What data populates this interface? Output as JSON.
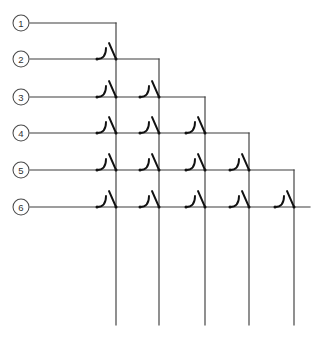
{
  "diagram": {
    "type": "schematic",
    "canvas": {
      "width": 319,
      "height": 340
    },
    "colors": {
      "line": "#3d3d3d",
      "switch": "#111111",
      "node_stroke": "#4a4a4a",
      "background": "#ffffff"
    },
    "geometry": {
      "node_center_x": 21,
      "node_radius": 8,
      "row_y": [
        23,
        59,
        97,
        133,
        170,
        207
      ],
      "column_x": [
        116,
        159,
        205,
        249,
        294
      ],
      "column_bottom_y": 325,
      "row_right_end_x": 310,
      "hook_offset_x": -19,
      "blade_offset_y": -16
    },
    "rows": [
      {
        "id": "row-1",
        "label": "1",
        "y": 23,
        "turn_down_x": 116,
        "switch_columns": []
      },
      {
        "id": "row-2",
        "label": "2",
        "y": 59,
        "turn_down_x": 159,
        "switch_columns": [
          116
        ]
      },
      {
        "id": "row-3",
        "label": "3",
        "y": 97,
        "turn_down_x": 205,
        "switch_columns": [
          116,
          159
        ]
      },
      {
        "id": "row-4",
        "label": "4",
        "y": 133,
        "turn_down_x": 249,
        "switch_columns": [
          116,
          159,
          205
        ]
      },
      {
        "id": "row-5",
        "label": "5",
        "y": 170,
        "turn_down_x": 294,
        "switch_columns": [
          116,
          159,
          205,
          249
        ]
      },
      {
        "id": "row-6",
        "label": "6",
        "y": 207,
        "turn_down_x": 310,
        "switch_columns": [
          116,
          159,
          205,
          249,
          294
        ]
      }
    ],
    "columns": [
      {
        "id": "col-1",
        "x": 116,
        "top_y": 23,
        "bottom_y": 325
      },
      {
        "id": "col-2",
        "x": 159,
        "top_y": 59,
        "bottom_y": 325
      },
      {
        "id": "col-3",
        "x": 205,
        "top_y": 97,
        "bottom_y": 325
      },
      {
        "id": "col-4",
        "x": 249,
        "top_y": 133,
        "bottom_y": 325
      },
      {
        "id": "col-5",
        "x": 294,
        "top_y": 170,
        "bottom_y": 325
      }
    ],
    "node_labels": [
      "1",
      "2",
      "3",
      "4",
      "5",
      "6"
    ],
    "switch_count": 15
  }
}
